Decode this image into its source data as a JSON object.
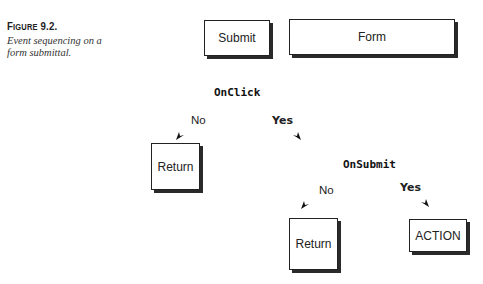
{
  "caption": {
    "figure_label_first": "F",
    "figure_label_rest": "IGURE",
    "figure_number": " 9.2.",
    "text_line1": "Event sequencing on a",
    "text_line2": "form submittal."
  },
  "top_boxes": {
    "submit": "Submit",
    "form": "Form"
  },
  "onclick": {
    "label": "OnClick",
    "no_label": "No",
    "yes_label": "Yes",
    "no_target": "Return"
  },
  "onsubmit": {
    "label": "OnSubmit",
    "no_label": "No",
    "yes_label": "Yes",
    "no_target": "Return",
    "yes_target": "ACTION"
  },
  "icons": {
    "arrowhead": "filled-triangle-arrowhead"
  }
}
